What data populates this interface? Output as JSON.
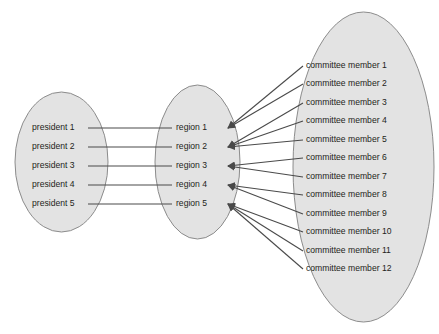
{
  "figure": {
    "title_fragment": "",
    "sets": [
      {
        "id": "presidents",
        "name": "presidents-set",
        "members": [
          "president 1",
          "president 2",
          "president 3",
          "president 4",
          "president 5"
        ]
      },
      {
        "id": "regions",
        "name": "regions-set",
        "members": [
          "region 1",
          "region 2",
          "region 3",
          "region 4",
          "region 5"
        ]
      },
      {
        "id": "committee",
        "name": "committee-members-set",
        "members": [
          "committee member 1",
          "committee member 2",
          "committee member 3",
          "committee member 4",
          "committee member 5",
          "committee member 6",
          "committee member 7",
          "committee member 8",
          "committee member 9",
          "committee member 10",
          "committee member 11",
          "committee member 12"
        ]
      }
    ],
    "mappings": {
      "president_to_region": [
        {
          "from": "president 1",
          "to": "region 1"
        },
        {
          "from": "president 2",
          "to": "region 2"
        },
        {
          "from": "president 3",
          "to": "region 3"
        },
        {
          "from": "president 4",
          "to": "region 4"
        },
        {
          "from": "president 5",
          "to": "region 5"
        }
      ],
      "committee_to_region": [
        {
          "from": "committee member 1",
          "to": "region 1"
        },
        {
          "from": "committee member 2",
          "to": "region 1"
        },
        {
          "from": "committee member 3",
          "to": "region 2"
        },
        {
          "from": "committee member 4",
          "to": "region 2"
        },
        {
          "from": "committee member 5",
          "to": "region 2"
        },
        {
          "from": "committee member 6",
          "to": "region 3"
        },
        {
          "from": "committee member 7",
          "to": "region 3"
        },
        {
          "from": "committee member 8",
          "to": "region 4"
        },
        {
          "from": "committee member 9",
          "to": "region 4"
        },
        {
          "from": "committee member 10",
          "to": "region 5"
        },
        {
          "from": "committee member 11",
          "to": "region 5"
        },
        {
          "from": "committee member 12",
          "to": "region 5"
        }
      ]
    },
    "colors": {
      "ellipse_fill": "#e3e3e3",
      "ellipse_stroke": "#8c8c8c",
      "line": "#4a4a4a",
      "text": "#231f20",
      "background": "#ffffff"
    }
  }
}
